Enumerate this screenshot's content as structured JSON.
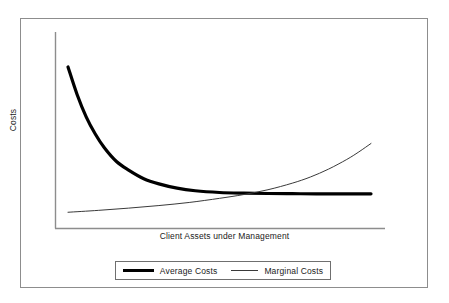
{
  "chart_data": {
    "type": "line",
    "title": "",
    "xlabel": "Client Assets under Management",
    "ylabel": "Costs",
    "grid": false,
    "axis_ticks": false,
    "legend_position": "bottom",
    "xlim": [
      0,
      100
    ],
    "ylim": [
      0,
      100
    ],
    "series": [
      {
        "name": "Average Costs",
        "style": "thick",
        "color": "#000000",
        "linewidth": 3.2,
        "description": "Steeply declining convex curve flattening to a horizontal asymptote",
        "x": [
          0,
          3,
          6,
          9,
          12,
          16,
          20,
          25,
          30,
          36,
          42,
          50,
          58,
          66,
          74,
          82,
          90,
          100
        ],
        "y": [
          89,
          73,
          60,
          50,
          42,
          34,
          29,
          24,
          21,
          18.5,
          17,
          16,
          15.6,
          15.4,
          15.3,
          15.2,
          15.2,
          15.2
        ]
      },
      {
        "name": "Marginal Costs",
        "style": "thin",
        "color": "#3a3a3a",
        "linewidth": 1,
        "description": "Gently rising convex curve crossing the average cost curve near the right side",
        "x": [
          0,
          10,
          20,
          30,
          40,
          50,
          58,
          66,
          74,
          80,
          86,
          92,
          96,
          100
        ],
        "y": [
          4.5,
          5.6,
          6.9,
          8.4,
          10.2,
          12.6,
          14.8,
          17.6,
          21.4,
          25.0,
          29.6,
          35.2,
          39.6,
          44.5
        ]
      }
    ],
    "annotations": [
      {
        "name": "intersection",
        "label": "Marginal Costs crosses Average Costs",
        "x": 79.5,
        "y": 15.2
      }
    ]
  },
  "legend": {
    "entries": [
      {
        "label": "Average Costs",
        "swatch": "thick-line-swatch"
      },
      {
        "label": "Marginal Costs",
        "swatch": "thin-line-swatch"
      }
    ]
  }
}
